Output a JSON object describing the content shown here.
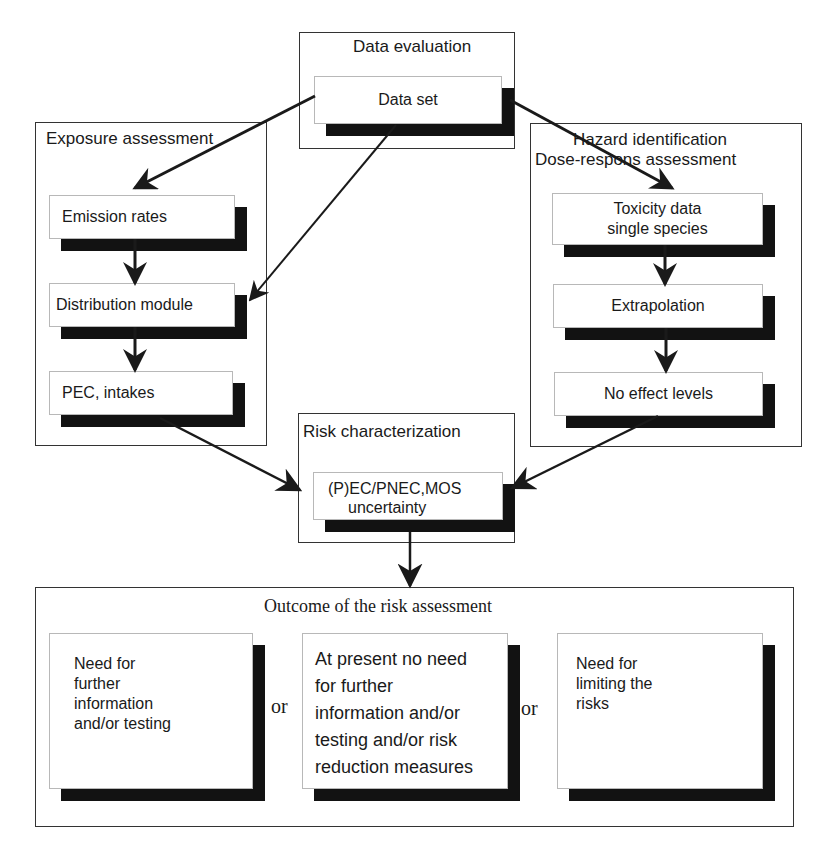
{
  "diagram": {
    "data_evaluation": {
      "title": "Data evaluation",
      "node": "Data set"
    },
    "exposure_assessment": {
      "title": "Exposure assessment",
      "nodes": [
        "Emission rates",
        "Distribution module",
        "PEC, intakes"
      ]
    },
    "hazard_identification": {
      "title_line1": "Hazard identification",
      "title_line2": "Dose-respons assessment",
      "nodes": [
        {
          "line1": "Toxicity data",
          "line2": "single species"
        },
        {
          "line1": "Extrapolation"
        },
        {
          "line1": "No effect levels"
        }
      ]
    },
    "risk_characterization": {
      "title": "Risk characterization",
      "node_line1": "(P)EC/PNEC,MOS",
      "node_line2": "uncertainty"
    },
    "outcome": {
      "title": "Outcome of the risk assessment",
      "separator": "or",
      "options": [
        {
          "lines": [
            "Need for",
            "further",
            "information",
            "and/or testing"
          ]
        },
        {
          "lines": [
            "At present no need",
            "for further",
            "information and/or",
            "testing and/or risk",
            "reduction measures"
          ]
        },
        {
          "lines": [
            "Need for",
            "limiting the",
            "risks"
          ]
        }
      ]
    },
    "colors": {
      "frame_border": "#333333",
      "shadow": "#121212",
      "arrow": "#1a1a1a"
    }
  }
}
